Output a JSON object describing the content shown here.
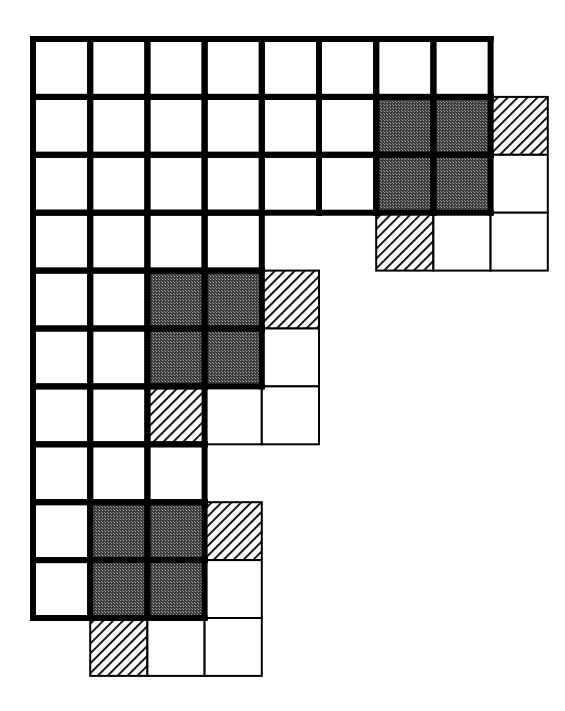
{
  "diagram": {
    "type": "grid-tiling-figure",
    "grid": {
      "cols": 8,
      "rows": 10,
      "origin_x": 33,
      "origin_y": 39,
      "cell_w": 57.2,
      "cell_h": 57.9,
      "thick_line": 6,
      "thin_line": 2
    },
    "colors": {
      "background": "#ffffff",
      "line": "#000000",
      "dark_fill": "#4a4a4a",
      "dark_fill_dot": "#9a9a9a",
      "hatch": "#000000"
    },
    "main_region_rows": [
      {
        "row": 0,
        "cols": [
          0,
          1,
          2,
          3,
          4,
          5,
          6,
          7
        ]
      },
      {
        "row": 1,
        "cols": [
          0,
          1,
          2,
          3,
          4,
          5,
          6,
          7
        ]
      },
      {
        "row": 2,
        "cols": [
          0,
          1,
          2,
          3,
          4,
          5,
          6,
          7
        ]
      },
      {
        "row": 3,
        "cols": [
          0,
          1,
          2,
          3
        ]
      },
      {
        "row": 4,
        "cols": [
          0,
          1,
          2,
          3
        ]
      },
      {
        "row": 5,
        "cols": [
          0,
          1,
          2,
          3
        ]
      },
      {
        "row": 6,
        "cols": [
          0,
          1,
          2
        ]
      },
      {
        "row": 7,
        "cols": [
          0,
          1,
          2
        ]
      },
      {
        "row": 8,
        "cols": [
          0,
          1,
          2
        ]
      },
      {
        "row": 9,
        "cols": [
          0,
          1,
          2
        ]
      }
    ],
    "dark_blocks": [
      {
        "row": 1,
        "col": 6,
        "size": 2
      },
      {
        "row": 4,
        "col": 2,
        "size": 2
      },
      {
        "row": 8,
        "col": 1,
        "size": 2
      }
    ],
    "hatched_cells": [
      {
        "row": 1,
        "col": 8
      },
      {
        "row": 3,
        "col": 6
      },
      {
        "row": 4,
        "col": 4
      },
      {
        "row": 6,
        "col": 2
      },
      {
        "row": 8,
        "col": 3
      },
      {
        "row": 10,
        "col": 1
      }
    ],
    "outside_thin_cells": [
      {
        "row": 1,
        "col": 8
      },
      {
        "row": 2,
        "col": 8
      },
      {
        "row": 3,
        "col": 6
      },
      {
        "row": 3,
        "col": 7
      },
      {
        "row": 3,
        "col": 8
      },
      {
        "row": 4,
        "col": 4
      },
      {
        "row": 5,
        "col": 4
      },
      {
        "row": 6,
        "col": 3
      },
      {
        "row": 6,
        "col": 4
      },
      {
        "row": 8,
        "col": 3
      },
      {
        "row": 9,
        "col": 3
      },
      {
        "row": 10,
        "col": 1
      },
      {
        "row": 10,
        "col": 2
      },
      {
        "row": 10,
        "col": 3
      }
    ]
  }
}
